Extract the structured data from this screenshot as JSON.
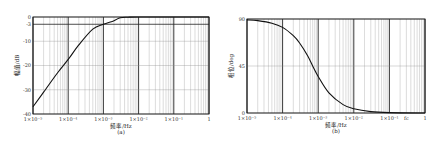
{
  "chart_data": [
    {
      "id": "a",
      "type": "line",
      "caption": "(a)",
      "title": "",
      "xlabel": "频率/Hz",
      "ylabel": "幅值/dB",
      "xscale": "log",
      "xlim": [
        1e-05,
        1
      ],
      "ylim": [
        -40,
        0
      ],
      "x_ticks": [
        "1×10⁻⁵",
        "1×10⁻⁴",
        "1×10⁻³",
        "1×10⁻²",
        "1×10⁻¹",
        "1"
      ],
      "y_ticks": [
        "0",
        "-3",
        "-10",
        "-20",
        "-30",
        "-40"
      ],
      "y_tick_values": [
        0,
        -3,
        -10,
        -20,
        -30,
        -40
      ],
      "grid": true,
      "series": [
        {
          "name": "magnitude",
          "x": [
            1e-05,
            2e-05,
            5e-05,
            0.0001,
            0.0002,
            0.0005,
            0.001,
            0.002,
            0.003,
            0.005,
            0.01,
            0.1,
            1
          ],
          "values": [
            -37,
            -31,
            -23,
            -17.5,
            -11.5,
            -5,
            -3,
            -1.5,
            -0.3,
            -0.1,
            0,
            0,
            0
          ]
        }
      ]
    },
    {
      "id": "b",
      "type": "line",
      "caption": "(b)",
      "title": "",
      "xlabel": "频率/Hz",
      "ylabel": "相位/deg",
      "xscale": "log",
      "xlim": [
        1e-05,
        1
      ],
      "ylim": [
        0,
        90
      ],
      "x_ticks": [
        "1×10⁻⁵",
        "1×10⁻⁴",
        "1×10⁻³",
        "1×10⁻²",
        "1×10⁻¹",
        "1"
      ],
      "y_ticks": [
        "90",
        "45",
        "0"
      ],
      "y_tick_values": [
        90,
        45,
        0
      ],
      "grid": true,
      "annotation": "fc",
      "series": [
        {
          "name": "phase",
          "x": [
            1e-05,
            2e-05,
            5e-05,
            0.0001,
            0.0002,
            0.0003,
            0.0005,
            0.0007,
            0.001,
            0.002,
            0.005,
            0.01,
            0.03,
            0.1,
            1
          ],
          "values": [
            89.2,
            88.4,
            86,
            82,
            74,
            67,
            55,
            45,
            35,
            19.3,
            8,
            4,
            1.3,
            0.4,
            0
          ]
        }
      ]
    }
  ]
}
